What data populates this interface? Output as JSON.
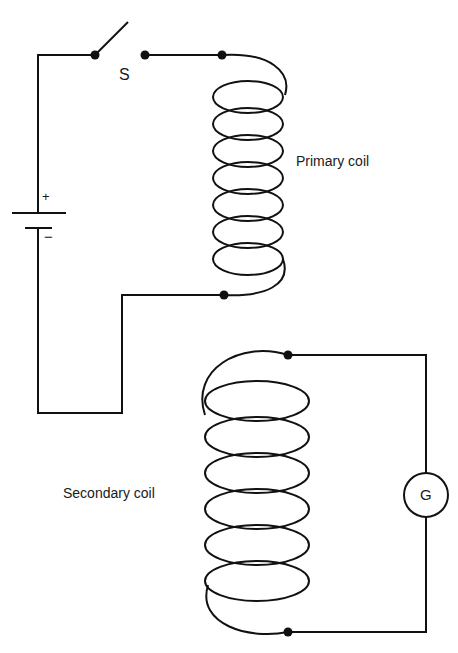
{
  "diagram": {
    "type": "mutual induction circuit",
    "labels": {
      "switch": "S",
      "primary_coil": "Primary coil",
      "secondary_coil": "Secondary coil",
      "galvanometer": "G",
      "battery_positive": "+",
      "battery_negative": "−"
    },
    "components": [
      {
        "name": "switch",
        "label": "S",
        "state": "open"
      },
      {
        "name": "battery",
        "terminals": [
          "+",
          "−"
        ]
      },
      {
        "name": "primary-coil",
        "label": "Primary coil",
        "turns": 7
      },
      {
        "name": "secondary-coil",
        "label": "Secondary coil",
        "turns": 7
      },
      {
        "name": "galvanometer",
        "label": "G"
      }
    ],
    "colors": {
      "line": "#111111",
      "background": "#ffffff"
    }
  }
}
